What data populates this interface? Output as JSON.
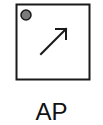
{
  "symbol": {
    "name": "access-point",
    "label": "AP",
    "colors": {
      "stroke": "#1a1a1a",
      "fill": "#ffffff",
      "indicator": "#7a7a7a"
    }
  }
}
